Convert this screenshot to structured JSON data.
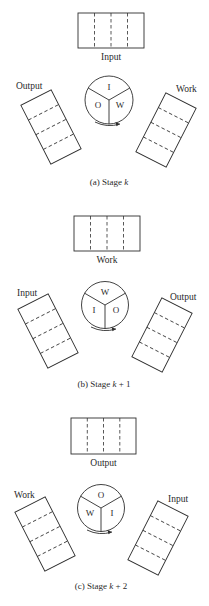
{
  "stages": [
    {
      "caption_prefix": "(a) Stage ",
      "caption_var": "k",
      "caption_suffix": "",
      "top_label": "Input",
      "left_label": "Output",
      "right_label": "Work",
      "wheel": {
        "top": "I",
        "left": "O",
        "right": "W"
      }
    },
    {
      "caption_prefix": "(b) Stage ",
      "caption_var": "k",
      "caption_suffix": " + 1",
      "top_label": "Work",
      "left_label": "Input",
      "right_label": "Output",
      "wheel": {
        "top": "W",
        "left": "I",
        "right": "O"
      }
    },
    {
      "caption_prefix": "(c) Stage ",
      "caption_var": "k",
      "caption_suffix": " + 2",
      "top_label": "Output",
      "left_label": "Work",
      "right_label": "Input",
      "wheel": {
        "top": "O",
        "left": "W",
        "right": "I"
      }
    }
  ]
}
